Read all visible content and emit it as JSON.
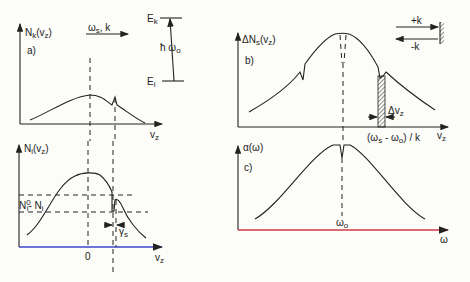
{
  "diagram": {
    "panel_a": {
      "label": "a)",
      "ylabel": "N",
      "ylabel_sub": "k",
      "ylabel_arg": "(v",
      "ylabel_arg_sub": "z",
      "ylabel_close": ")",
      "xlabel": "v",
      "xlabel_sub": "z",
      "beam_label": "ω",
      "beam_label_sub": "s",
      "beam_k": ", k",
      "level_upper": "E",
      "level_upper_sub": "k",
      "level_lower": "E",
      "level_lower_sub": "i",
      "transition_label": "ħ  ω",
      "transition_sub": "o"
    },
    "panel_lower_left": {
      "ylabel": "N",
      "ylabel_sub": "i",
      "ylabel_arg": "(v",
      "ylabel_arg_sub": "z",
      "ylabel_close": ")",
      "depth_label": "N",
      "depth_sup": "0",
      "depth_sub": "i",
      "depth_rest": "- N",
      "depth_rest_sub": "i",
      "width_label": "γ",
      "width_sub": "s",
      "origin_tick": "0",
      "xlabel": "v",
      "xlabel_sub": "z",
      "axis_color": "#3b46c9"
    },
    "panel_b": {
      "label": "b)",
      "ylabel": "ΔN",
      "ylabel_sub": "s",
      "ylabel_arg": "(v",
      "ylabel_arg_sub": "z",
      "ylabel_close": ")",
      "xlabel": "v",
      "xlabel_sub": "z",
      "plus_k": "+k",
      "minus_k": "-k",
      "dv_label": "Δv",
      "dv_sub": "z",
      "position_label": "(ω",
      "position_sub1": "s",
      "position_mid": " - ω",
      "position_sub2": "o",
      "position_end": ") / k"
    },
    "panel_c": {
      "label": "c)",
      "ylabel": "α(ω)",
      "center_label": "ω",
      "center_sub": "o",
      "xlabel": "ω",
      "axis_color": "#d23a4a"
    }
  }
}
